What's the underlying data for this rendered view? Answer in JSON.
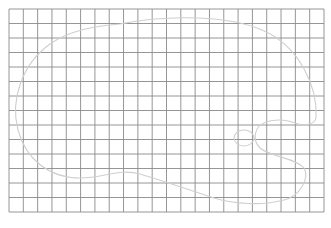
{
  "figure": {
    "type": "grid-with-outline",
    "background": "#ffffff",
    "grid": {
      "left": 9,
      "top": 9,
      "right": 324,
      "bottom": 212,
      "columns": 22,
      "rows": 14,
      "line_color": "#8a8a8a",
      "line_width": 0.9
    },
    "outline": {
      "shape": "palette",
      "stroke_color": "#cfcfcf",
      "stroke_width": 1.1,
      "body_path": "M 120 24 C 170 14, 230 16, 262 30 C 300 46, 318 88, 316 118 C 315 124, 306 126, 298 124 C 288 120, 278 118, 266 122 C 254 126, 252 140, 260 148 C 268 156, 296 158, 304 168 C 310 178, 300 196, 284 200 C 262 206, 234 204, 214 198 C 190 190, 160 180, 140 174 C 120 168, 104 178, 80 178 C 50 178, 26 160, 18 130 C 10 100, 22 64, 50 44 C 70 30, 96 26, 120 24 Z",
      "hole": {
        "cx": 244,
        "cy": 138,
        "rx": 10,
        "ry": 8
      }
    }
  }
}
